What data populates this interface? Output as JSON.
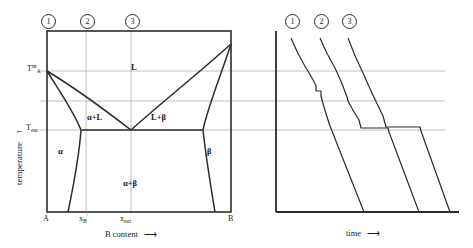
{
  "figure": {
    "title_kind": "binary-eutectic-phase-diagram-with-cooling-curves",
    "left_panel": {
      "name": "eutectic-phase-diagram",
      "y_axis_label": "temperature",
      "y_axis_arrow": "↑",
      "x_axis_label": "B content",
      "x_axis_arrow": "⟶",
      "y_ticks": [
        {
          "id": "t-melt-a",
          "text_main": "T",
          "sup": "m",
          "sub": "A",
          "y": 71
        },
        {
          "id": "t-eutectic",
          "text_main": "T",
          "sup": "",
          "sub": "eut",
          "y": 130
        }
      ],
      "x_ticks": [
        {
          "id": "x-a",
          "text_main": "A",
          "sub": "",
          "sup": "",
          "x": 47
        },
        {
          "id": "x-b-prime",
          "text_main": "x",
          "sub": "B",
          "sup": "′",
          "x": 86
        },
        {
          "id": "x-eutectic",
          "text_main": "x",
          "sub": "eut",
          "sup": "",
          "x": 131
        },
        {
          "id": "x-b",
          "text_main": "B",
          "sub": "",
          "sup": "",
          "x": 231
        }
      ],
      "regions": [
        {
          "id": "region-liquid",
          "label": "L",
          "x": 134,
          "y": 68
        },
        {
          "id": "region-alpha-plus-liquid",
          "label": "α+L",
          "x": 94,
          "y": 118
        },
        {
          "id": "region-liquid-plus-beta",
          "label": "L+β",
          "x": 158,
          "y": 118
        },
        {
          "id": "region-alpha",
          "label": "α",
          "x": 60,
          "y": 152
        },
        {
          "id": "region-beta",
          "label": "β",
          "x": 209,
          "y": 152
        },
        {
          "id": "region-alpha-plus-beta",
          "label": "α+β",
          "x": 131,
          "y": 184
        }
      ],
      "composition_markers": [
        {
          "id": "marker-1",
          "label": "1",
          "x": 47
        },
        {
          "id": "marker-2",
          "label": "2",
          "x": 86
        },
        {
          "id": "marker-3",
          "label": "3",
          "x": 131
        }
      ]
    },
    "right_panel": {
      "name": "cooling-curves",
      "x_axis_label": "time",
      "x_axis_arrow": "⟶",
      "curve_markers": [
        {
          "id": "curve-marker-1",
          "label": "1",
          "x": 291
        },
        {
          "id": "curve-marker-2",
          "label": "2",
          "x": 320
        },
        {
          "id": "curve-marker-3",
          "label": "3",
          "x": 348
        }
      ],
      "curves": [
        {
          "id": "cooling-curve-1",
          "label": "1"
        },
        {
          "id": "cooling-curve-2",
          "label": "2"
        },
        {
          "id": "cooling-curve-3",
          "label": "3"
        }
      ]
    },
    "tie_lines": [
      {
        "id": "tie-line-liquidus-a",
        "y": 71
      },
      {
        "id": "tie-line-intermediate",
        "y": 101
      },
      {
        "id": "tie-line-eutectic",
        "y": 130
      }
    ],
    "colors": {
      "line": "#2b2b2b",
      "grid": "#b9b9b9",
      "background": "#ffffff",
      "text": "#1a1a1a"
    }
  }
}
